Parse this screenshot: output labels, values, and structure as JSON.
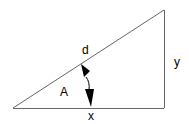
{
  "diagram": {
    "type": "right-triangle",
    "colors": {
      "line": "#666666",
      "arrow": "#000000",
      "text": "#000000",
      "background": "#ffffff"
    },
    "vertices": {
      "left": [
        13,
        108
      ],
      "right_bottom": [
        164,
        108
      ],
      "right_top": [
        164,
        10
      ]
    },
    "labels": {
      "hypotenuse": "d",
      "opposite": "y",
      "adjacent": "x",
      "angle": "A"
    },
    "arrow": {
      "kind": "double-headed-curved",
      "from": [
        82,
        65
      ],
      "to": [
        92,
        107
      ]
    }
  }
}
